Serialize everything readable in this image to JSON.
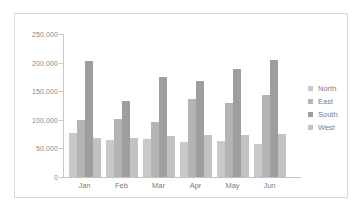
{
  "chart_data": {
    "type": "bar",
    "title": "",
    "subtitle": "",
    "xlabel": "",
    "ylabel": "",
    "categories": [
      "Jan",
      "Feb",
      "Mar",
      "Apr",
      "May",
      "Jun"
    ],
    "series": [
      {
        "name": "North",
        "color": "#c9c9c9",
        "values": [
          77000,
          65000,
          67000,
          61000,
          63000,
          57000
        ]
      },
      {
        "name": "East",
        "color": "#b4b4b4",
        "values": [
          100000,
          102000,
          96000,
          137000,
          129000,
          143000
        ]
      },
      {
        "name": "South",
        "color": "#9e9e9e",
        "values": [
          203000,
          133000,
          175000,
          168000,
          188000,
          204000
        ]
      },
      {
        "name": "West",
        "color": "#c2c2c2",
        "values": [
          69000,
          68000,
          71000,
          73000,
          74000,
          76000
        ]
      }
    ],
    "ylim": [
      0,
      250000
    ],
    "ytick_values": [
      0,
      50000,
      100000,
      150000,
      200000,
      250000
    ],
    "ytick_labels": [
      "0",
      "50,000",
      "100,000",
      "150,000",
      "200,000",
      "250,000"
    ],
    "grid": false,
    "legend_position": "right",
    "legend_entries": [
      "North",
      "East",
      "South",
      "West"
    ],
    "axis_color": "#c8c8c8",
    "tick_label_color": "#8a8a8a",
    "panel_border_color": "#d9d9d9",
    "background_color": "#ffffff"
  }
}
